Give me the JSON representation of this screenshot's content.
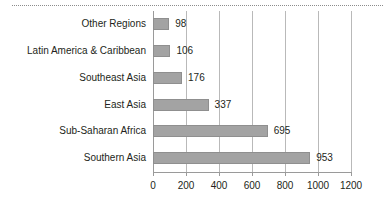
{
  "chart_data": {
    "type": "bar",
    "orientation": "horizontal",
    "title": "",
    "xlabel": "",
    "ylabel": "",
    "categories": [
      "Other Regions",
      "Latin America & Caribbean",
      "Southeast Asia",
      "East Asia",
      "Sub-Saharan Africa",
      "Southern Asia"
    ],
    "values": [
      98,
      106,
      176,
      337,
      695,
      953
    ],
    "data_labels": [
      "98",
      "106",
      "176",
      "337",
      "695",
      "953"
    ],
    "xlim": [
      0,
      1200
    ],
    "xticks": [
      0,
      200,
      400,
      600,
      800,
      1000,
      1200
    ],
    "xtick_labels": [
      "0",
      "200",
      "400",
      "600",
      "800",
      "1000",
      "1200"
    ],
    "grid": "vertical",
    "legend": "none",
    "bar_color": "#a3a3a3",
    "bar_edge_color": "#8f8f8f",
    "grid_color": "#b9b9b9",
    "axis_color": "#9a9a9a",
    "text_color": "#231f20"
  }
}
